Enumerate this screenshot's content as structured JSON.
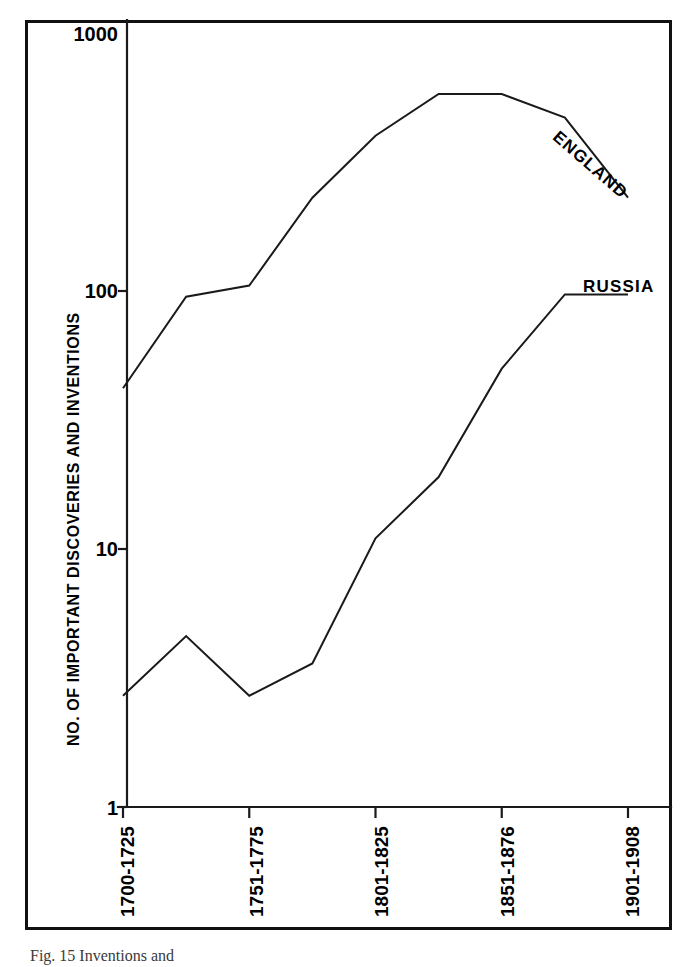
{
  "chart_data": {
    "type": "line",
    "title": "",
    "xlabel": "",
    "ylabel": "NO. OF IMPORTANT DISCOVERIES AND INVENTIONS",
    "scale": "log",
    "ylim": [
      1,
      1000
    ],
    "ytick_labels": [
      "1000",
      "100",
      "10",
      "1"
    ],
    "ytick_values": [
      1000,
      100,
      10,
      1
    ],
    "grid": false,
    "legend_position": "inline-labels",
    "xtick_labels": [
      "1700-1725",
      "1751-1775",
      "1801-1825",
      "1851-1876",
      "1901-1908"
    ],
    "x_periods": [
      "1700-1725",
      "1726-1750",
      "1751-1775",
      "1776-1800",
      "1801-1825",
      "1826-1850",
      "1851-1876",
      "1877-1900",
      "1901-1908"
    ],
    "series": [
      {
        "name": "ENGLAND",
        "label": "ENGLAND",
        "values": [
          42,
          95,
          105,
          230,
          400,
          580,
          580,
          470,
          230
        ]
      },
      {
        "name": "RUSSIA",
        "label": "RUSSIA",
        "values": [
          2.7,
          4.6,
          2.7,
          3.6,
          11,
          19,
          50,
          97,
          97
        ]
      }
    ],
    "annotations": [
      {
        "text": "ENGLAND",
        "series": "ENGLAND"
      },
      {
        "text": "RUSSIA",
        "series": "RUSSIA"
      }
    ]
  },
  "caption": {
    "text": "Fig. 15 Inventions and"
  },
  "colors": {
    "ink": "#1a1a1a",
    "frame": "#111111",
    "background": "#ffffff"
  }
}
